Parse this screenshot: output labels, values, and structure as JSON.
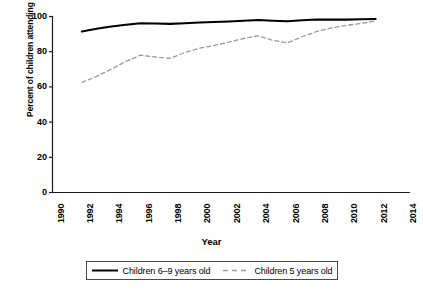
{
  "chart_data": {
    "type": "line",
    "title": "",
    "xlabel": "Year",
    "ylabel": "Percent of children attending school",
    "xlim": [
      1990,
      2014
    ],
    "ylim": [
      0,
      100
    ],
    "grid": false,
    "legend_position": "below-axis",
    "x_ticks": [
      "1990",
      "1992",
      "1994",
      "1996",
      "1998",
      "2000",
      "2002",
      "2004",
      "2006",
      "2008",
      "2010",
      "2012",
      "2014"
    ],
    "y_ticks": [
      "0",
      "20",
      "40",
      "60",
      "80",
      "100"
    ],
    "x": [
      1992,
      1993,
      1994,
      1995,
      1996,
      1997,
      1998,
      1999,
      2000,
      2001,
      2002,
      2003,
      2004,
      2005,
      2006,
      2007,
      2008,
      2009,
      2010,
      2011,
      2012
    ],
    "series": [
      {
        "name": "Children 6–9 years old",
        "style": "solid",
        "color": "#000000",
        "values": [
          91.5,
          93.0,
          94.3,
          95.3,
          96.2,
          96.0,
          95.8,
          96.2,
          96.6,
          96.9,
          97.2,
          97.6,
          98.0,
          97.6,
          97.3,
          97.9,
          98.3,
          98.2,
          98.2,
          98.4,
          98.6
        ]
      },
      {
        "name": "Children 5 years old",
        "style": "dashed",
        "color": "#9a9a9a",
        "values": [
          62.5,
          66.0,
          70.0,
          74.5,
          78.0,
          77.0,
          76.2,
          79.5,
          82.0,
          83.5,
          85.5,
          87.5,
          89.0,
          86.5,
          85.0,
          88.5,
          91.5,
          93.5,
          95.0,
          96.0,
          97.5
        ]
      }
    ]
  },
  "axis": {
    "ylabel": "Percent of children attending school",
    "xlabel": "Year"
  },
  "legend": {
    "entries": [
      {
        "label": "Children 6–9 years old",
        "style": "solid"
      },
      {
        "label": "Children 5 years old",
        "style": "dashed"
      }
    ]
  }
}
